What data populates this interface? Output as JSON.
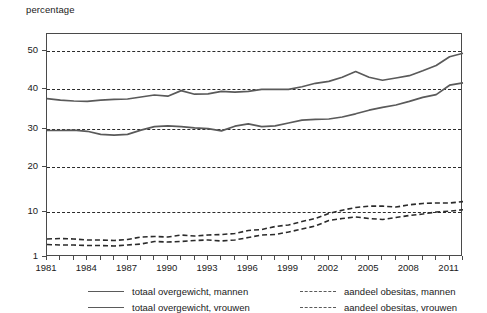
{
  "chart_data": {
    "type": "line",
    "title": "",
    "ylabel": "percentage",
    "xlabel": "",
    "grid": true,
    "legend_position": "bottom",
    "y_scale": "piecewise (1-10 compressed, 10-50 linear)",
    "ylim": [
      1,
      56
    ],
    "xlim": [
      1981,
      2012
    ],
    "y_ticks": [
      1,
      10,
      20,
      30,
      40,
      50
    ],
    "x_ticks": [
      1981,
      1984,
      1987,
      1990,
      1993,
      1996,
      1999,
      2002,
      2005,
      2008,
      2011
    ],
    "x_tick_step_minor": 1,
    "x": [
      1981,
      1982,
      1983,
      1984,
      1985,
      1986,
      1987,
      1988,
      1989,
      1990,
      1991,
      1992,
      1993,
      1994,
      1995,
      1996,
      1997,
      1998,
      1999,
      2000,
      2001,
      2002,
      2003,
      2004,
      2005,
      2006,
      2007,
      2008,
      2009,
      2010,
      2011,
      2012
    ],
    "series": [
      {
        "name": "totaal overgewicht, mannen",
        "style": "solid",
        "color": "#5a5a5a",
        "values": [
          37.6,
          37.2,
          37.0,
          36.9,
          37.2,
          37.4,
          37.5,
          38.0,
          38.5,
          38.2,
          39.6,
          38.7,
          38.8,
          39.4,
          39.2,
          39.4,
          39.9,
          39.9,
          39.9,
          40.6,
          41.5,
          42.0,
          43.1,
          44.6,
          43.1,
          42.3,
          42.9,
          43.5,
          44.8,
          46.2,
          48.5,
          49.4
        ]
      },
      {
        "name": "totaal overgewicht, vrouwen",
        "style": "solid",
        "color": "#5a5a5a",
        "values": [
          29.6,
          29.6,
          29.7,
          29.4,
          28.6,
          28.4,
          28.6,
          29.7,
          30.6,
          30.8,
          30.6,
          30.3,
          30.1,
          29.5,
          30.7,
          31.3,
          30.6,
          30.8,
          31.5,
          32.2,
          32.4,
          32.5,
          33.0,
          33.8,
          34.7,
          35.4,
          36.0,
          36.9,
          37.9,
          38.6,
          41.0,
          41.6
        ]
      },
      {
        "name": "aandeel obesitas, mannen",
        "style": "dashed",
        "color": "#2b2b2b",
        "values": [
          3.5,
          3.4,
          3.4,
          3.3,
          3.3,
          3.2,
          3.4,
          3.6,
          4.1,
          4.0,
          4.1,
          4.3,
          4.4,
          4.2,
          4.4,
          4.9,
          5.4,
          5.5,
          6.0,
          6.6,
          7.2,
          8.3,
          8.7,
          9.0,
          8.7,
          8.5,
          8.9,
          9.3,
          9.6,
          10.0,
          10.2,
          10.5
        ]
      },
      {
        "name": "aandeel obesitas, vrouwen",
        "style": "dashed",
        "color": "#2b2b2b",
        "values": [
          4.6,
          4.7,
          4.6,
          4.4,
          4.4,
          4.3,
          4.5,
          5.0,
          5.1,
          5.0,
          5.4,
          5.2,
          5.4,
          5.5,
          5.7,
          6.3,
          6.5,
          7.1,
          7.4,
          8.1,
          8.7,
          9.7,
          10.4,
          11.0,
          11.3,
          11.3,
          11.1,
          11.6,
          11.9,
          12.0,
          12.0,
          12.3
        ]
      }
    ]
  },
  "axis": {
    "y_title": "percentage",
    "y_tick_labels": [
      "50",
      "40",
      "30",
      "20",
      "10",
      "1"
    ],
    "x_tick_labels": [
      "1981",
      "1984",
      "1987",
      "1990",
      "1993",
      "1996",
      "1999",
      "2002",
      "2005",
      "2008",
      "2011"
    ]
  },
  "legend": {
    "items": [
      {
        "label": "totaal overgewicht, mannen",
        "style": "solid",
        "column": "left",
        "row": 0
      },
      {
        "label": "totaal overgewicht, vrouwen",
        "style": "solid",
        "column": "left",
        "row": 1
      },
      {
        "label": "aandeel obesitas, mannen",
        "style": "dashed",
        "column": "right",
        "row": 0
      },
      {
        "label": "aandeel obesitas, vrouwen",
        "style": "dashed",
        "column": "right",
        "row": 1
      }
    ]
  },
  "colors": {
    "line_solid": "#5a5a5a",
    "line_dashed": "#2b2b2b",
    "frame": "#4a4a4a",
    "grid": "#2b2b2b",
    "background": "#ffffff",
    "text": "#1a1a1a"
  }
}
